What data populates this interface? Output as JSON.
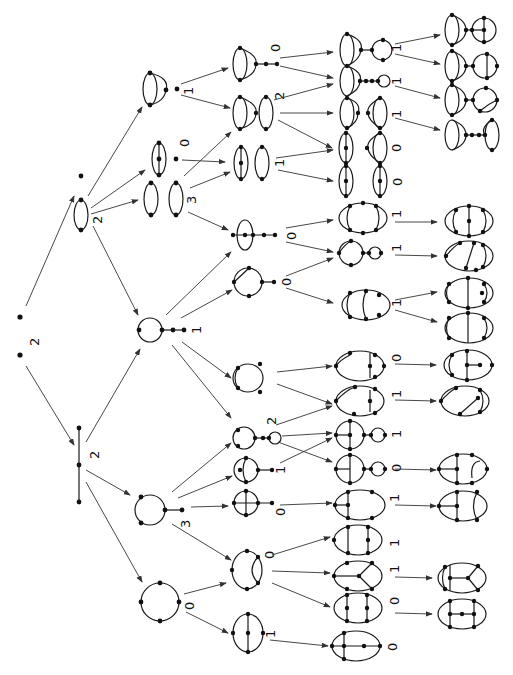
{
  "diagram": {
    "root": {
      "label": "2x"
    },
    "level1": [
      {
        "id": "L1a",
        "shape": "two-vertex loop plus isolated vertex",
        "label": "2"
      },
      {
        "id": "L1b",
        "shape": "three-vertex path",
        "label": "2"
      }
    ],
    "level2": [
      {
        "id": "L2a",
        "shape": "sunset triangle plus vertex",
        "label": "1"
      },
      {
        "id": "L2b",
        "shape": "theta / double loop pair",
        "label": "0"
      },
      {
        "id": "L2c",
        "shape": "double loop pair",
        "label": "3"
      },
      {
        "id": "L2d",
        "shape": "loop with tail",
        "label": "1"
      },
      {
        "id": "L2e",
        "shape": "loop with vertex tail",
        "label": "3"
      },
      {
        "id": "L2f",
        "shape": "four-vertex ring",
        "label": "0"
      }
    ],
    "labels": {
      "root": "2",
      "root_sup": "+",
      "l1a": "2",
      "l1b": "2",
      "l2a": "1",
      "l2b": "0",
      "l2c": "3",
      "l2d": "1",
      "l2e": "3",
      "l2f": "0",
      "l3": [
        "0",
        "2",
        "1",
        "0",
        "0",
        "2",
        "1",
        "0",
        "0",
        "2",
        "1"
      ],
      "l4": [
        "1",
        "1",
        "1",
        "0",
        "0",
        "1",
        "1",
        "1",
        "0",
        "1",
        "1",
        "0",
        "1",
        "1",
        "1",
        "0",
        "0"
      ]
    }
  }
}
